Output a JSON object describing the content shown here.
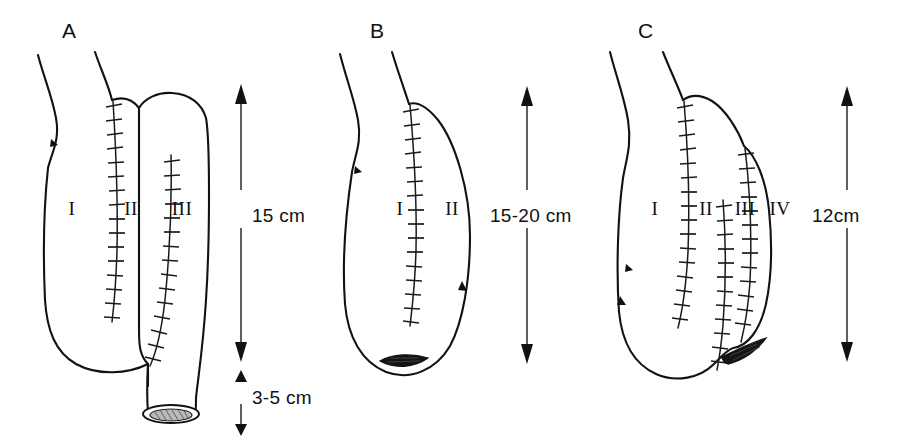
{
  "figure": {
    "background_color": "#ffffff",
    "ink_color": "#111111",
    "width": 914,
    "height": 443
  },
  "panels": [
    {
      "letter": "A",
      "letter_x": 62,
      "letter_y": 38,
      "segments": [
        {
          "numeral": "I",
          "x": 72,
          "y": 215
        },
        {
          "numeral": "II",
          "x": 131,
          "y": 215
        },
        {
          "numeral": "III",
          "x": 182,
          "y": 215
        }
      ],
      "dimensions": [
        {
          "label": "15 cm",
          "label_x": 252,
          "label_y": 215,
          "top": 88,
          "bottom": 358
        },
        {
          "label": "3-5 cm",
          "label_x": 252,
          "label_y": 398,
          "top": 368,
          "bottom": 430
        }
      ],
      "stoma_type": "tubular-end-stoma"
    },
    {
      "letter": "B",
      "letter_x": 370,
      "letter_y": 38,
      "segments": [
        {
          "numeral": "I",
          "x": 400,
          "y": 215
        },
        {
          "numeral": "II",
          "x": 452,
          "y": 215
        }
      ],
      "dimensions": [
        {
          "label": "15-20 cm",
          "label_x": 520,
          "label_y": 215,
          "top": 90,
          "bottom": 360
        }
      ],
      "stoma_type": "flat-slit-stoma"
    },
    {
      "letter": "C",
      "letter_x": 638,
      "letter_y": 38,
      "segments": [
        {
          "numeral": "I",
          "x": 655,
          "y": 215
        },
        {
          "numeral": "II",
          "x": 706,
          "y": 215
        },
        {
          "numeral": "III",
          "x": 745,
          "y": 215
        },
        {
          "numeral": "IV",
          "x": 780,
          "y": 215
        }
      ],
      "dimensions": [
        {
          "label": "12cm",
          "label_x": 845,
          "label_y": 215,
          "top": 90,
          "bottom": 358
        }
      ],
      "stoma_type": "oblique-slit-stoma"
    }
  ],
  "legend": {
    "suture_description": "sutured anastomosis line",
    "arrow_description": "bowel flow direction"
  }
}
